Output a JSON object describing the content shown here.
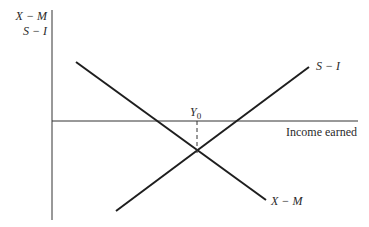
{
  "diagram": {
    "y_axis_label_line1": "X − M",
    "y_axis_label_line2": "S − I",
    "x_axis_label": "Income earned",
    "equilibrium_label": "Y",
    "equilibrium_subscript": "0",
    "curves": [
      {
        "name": "S − I",
        "slope": "upward"
      },
      {
        "name": "X − M",
        "slope": "downward"
      }
    ],
    "curve_labels": {
      "s_minus_i": "S − I",
      "x_minus_m": "X − M"
    },
    "colors": {
      "line": "#1e1e1e",
      "background": "#ffffff"
    }
  }
}
